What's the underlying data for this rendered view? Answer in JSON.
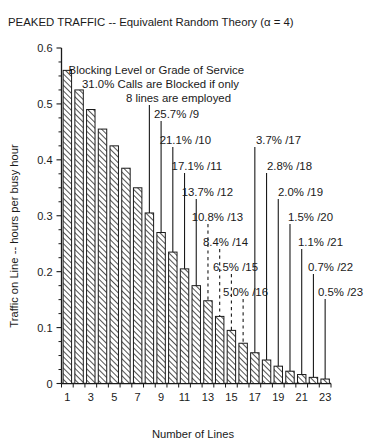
{
  "chart_data": {
    "type": "bar",
    "title": "PEAKED TRAFFIC -- Equivalent Random Theory (α = 4)",
    "xlabel": "Number of Lines",
    "ylabel": "Traffic on Line -- hours per busy hour",
    "categories": [
      1,
      2,
      3,
      4,
      5,
      6,
      7,
      8,
      9,
      10,
      11,
      12,
      13,
      14,
      15,
      16,
      17,
      18,
      19,
      20,
      21,
      22,
      23
    ],
    "values": [
      0.56,
      0.525,
      0.49,
      0.455,
      0.425,
      0.385,
      0.35,
      0.305,
      0.27,
      0.235,
      0.205,
      0.175,
      0.148,
      0.12,
      0.095,
      0.072,
      0.055,
      0.042,
      0.031,
      0.022,
      0.016,
      0.011,
      0.008
    ],
    "ylim": [
      0,
      0.6
    ],
    "xlim": [
      0.5,
      23.5
    ],
    "ytick_labels": [
      "0",
      "0.1",
      "0.2",
      "0.3",
      "0.4",
      "0.5",
      "0.6"
    ],
    "ytick_values": [
      0,
      0.1,
      0.2,
      0.3,
      0.4,
      0.5,
      0.6
    ],
    "yminor_step": 0.025,
    "xtick_labels": [
      "1",
      "3",
      "5",
      "7",
      "9",
      "11",
      "13",
      "15",
      "17",
      "19",
      "21",
      "23"
    ],
    "xtick_values": [
      1,
      3,
      5,
      7,
      9,
      11,
      13,
      15,
      17,
      19,
      21,
      23
    ],
    "grid": false,
    "legend": null,
    "bar_fill": "#ffffff",
    "bar_edge": "#1a1a1a",
    "bar_pattern": "diagonal-hatch",
    "annotations": [
      {
        "text": "Blocking Level or Grade of Service",
        "kind": "caption",
        "x": 244,
        "y": 74
      },
      {
        "text": "31.0% Calls are Blocked if only",
        "kind": "caption",
        "x": 239,
        "y": 88
      },
      {
        "text": "8 lines are employed",
        "kind": "label",
        "target_line": 8,
        "x": 231,
        "y": 102
      },
      {
        "text": "25.7% /9",
        "kind": "label",
        "target_line": 9,
        "x": 199,
        "y": 118
      },
      {
        "text": "21.1% /10",
        "kind": "label",
        "target_line": 10,
        "x": 211,
        "y": 144
      },
      {
        "text": "17.1% /11",
        "kind": "label",
        "target_line": 11,
        "x": 222,
        "y": 170
      },
      {
        "text": "13.7% /12",
        "kind": "label",
        "target_line": 12,
        "x": 233,
        "y": 196
      },
      {
        "text": "10.8% /13",
        "kind": "label",
        "target_line": 13,
        "x": 243,
        "y": 221
      },
      {
        "text": "8.4% /14",
        "kind": "label",
        "target_line": 14,
        "x": 248,
        "y": 246
      },
      {
        "text": "6.5% /15",
        "kind": "label",
        "target_line": 15,
        "x": 258,
        "y": 271
      },
      {
        "text": "5.0% /16",
        "kind": "label",
        "target_line": 16,
        "x": 268,
        "y": 296
      },
      {
        "text": "3.7% /17",
        "kind": "label",
        "target_line": 17,
        "x": 301,
        "y": 144
      },
      {
        "text": "2.8% /18",
        "kind": "label",
        "target_line": 18,
        "x": 312,
        "y": 170
      },
      {
        "text": "2.0% /19",
        "kind": "label",
        "target_line": 19,
        "x": 323,
        "y": 196
      },
      {
        "text": "1.5% /20",
        "kind": "label",
        "target_line": 20,
        "x": 333,
        "y": 221
      },
      {
        "text": "1.1% /21",
        "kind": "label",
        "target_line": 21,
        "x": 343,
        "y": 246
      },
      {
        "text": "0.7% /22",
        "kind": "label",
        "target_line": 22,
        "x": 353,
        "y": 271
      },
      {
        "text": "0.5% /23",
        "kind": "label",
        "target_line": 23,
        "x": 363,
        "y": 296
      }
    ]
  }
}
